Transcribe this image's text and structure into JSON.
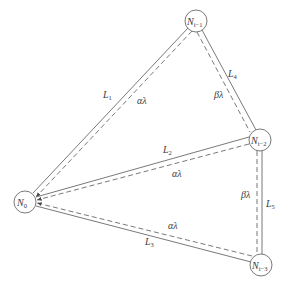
{
  "diagram": {
    "type": "network-graph",
    "nodes": [
      {
        "id": "N0",
        "label": "N",
        "sub": "0",
        "x": 25,
        "y": 202
      },
      {
        "id": "Ni1",
        "label": "N",
        "sub": "i−1",
        "x": 196,
        "y": 21
      },
      {
        "id": "Ni2",
        "label": "N",
        "sub": "i−2",
        "x": 260,
        "y": 140
      },
      {
        "id": "Ni3",
        "label": "N",
        "sub": "i−3",
        "x": 261,
        "y": 265
      }
    ],
    "edges": [
      {
        "id": "L1",
        "from": "N0",
        "to": "Ni1",
        "solid_label": "L",
        "solid_sub": "1",
        "dashed_label": "αλ"
      },
      {
        "id": "L4",
        "from": "Ni1",
        "to": "Ni2",
        "solid_label": "L",
        "solid_sub": "4",
        "dashed_label": "βλ"
      },
      {
        "id": "L2",
        "from": "Ni2",
        "to": "N0",
        "solid_label": "L",
        "solid_sub": "2",
        "dashed_label": "αλ"
      },
      {
        "id": "L5",
        "from": "Ni2",
        "to": "Ni3",
        "solid_label": "L",
        "solid_sub": "5",
        "dashed_label": "βλ"
      },
      {
        "id": "L3",
        "from": "Ni3",
        "to": "N0",
        "solid_label": "L",
        "solid_sub": "3",
        "dashed_label": "αλ"
      }
    ],
    "colors": {
      "line": "#6a6a6a",
      "text": "#3a3a3a",
      "background": "#ffffff"
    }
  }
}
